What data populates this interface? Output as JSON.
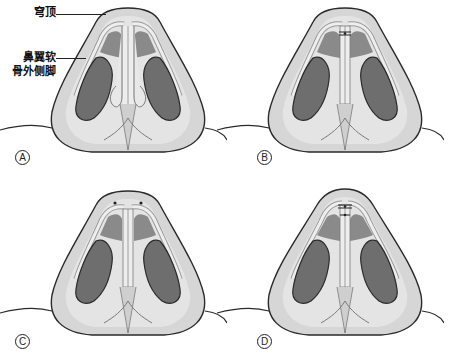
{
  "figure": {
    "annotations": {
      "dome": "穹顶",
      "lateral_crus_line1": "鼻翼软",
      "lateral_crus_line2": "骨外侧脚"
    },
    "panels": [
      {
        "id": "A",
        "label": "A",
        "suture": "none"
      },
      {
        "id": "B",
        "label": "B",
        "suture": "interdomal-single"
      },
      {
        "id": "C",
        "label": "C",
        "suture": "transdomal-dots"
      },
      {
        "id": "D",
        "label": "D",
        "suture": "interdomal-double"
      }
    ],
    "colors": {
      "skin": "#d9d9d9",
      "skin_light": "#ececec",
      "outline": "#2a2a2a",
      "nostril": "#6e6e6e",
      "cartilage": "#e6e6e6"
    }
  }
}
